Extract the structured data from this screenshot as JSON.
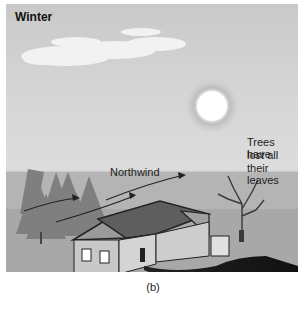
{
  "figure": {
    "title": "Winter",
    "caption": "(b)",
    "labels": {
      "wind": "Northwind",
      "trees_line1": "Trees have",
      "trees_line2": "lost all",
      "trees_line3": "their leaves"
    },
    "elements": [
      "clouds",
      "sun",
      "evergreen-trees",
      "wind-arrows",
      "bare-tree",
      "house",
      "driveway"
    ]
  }
}
